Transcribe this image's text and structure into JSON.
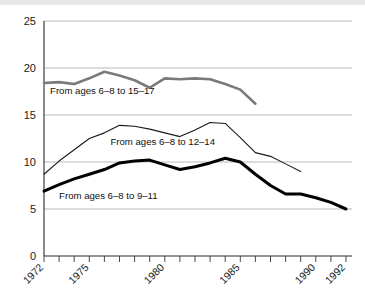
{
  "chart_data": {
    "type": "line",
    "title": "",
    "subtitle": "",
    "xlabel": "",
    "ylabel": "",
    "xlim": [
      1972,
      1992
    ],
    "ylim": [
      0,
      25
    ],
    "yticks": [
      0,
      5,
      10,
      15,
      20,
      25
    ],
    "ytick_labels": [
      "0",
      "5",
      "10",
      "15",
      "20",
      "25"
    ],
    "xticks": [
      1972,
      1973,
      1974,
      1975,
      1976,
      1977,
      1978,
      1979,
      1980,
      1981,
      1982,
      1983,
      1984,
      1985,
      1986,
      1987,
      1988,
      1989,
      1990,
      1991,
      1992
    ],
    "xtick_labels_shown": [
      "1972",
      "1975",
      "1980",
      "1985",
      "1990",
      "1992"
    ],
    "xtick_labels_shown_at": [
      1972,
      1975,
      1980,
      1985,
      1990,
      1992
    ],
    "xtick_label_rotation_deg": -45,
    "grid": "horizontal",
    "legend_position": "inline-annotations",
    "series": [
      {
        "name": "From ages 6-8 to 15-17",
        "label": "From ages 6–8 to 15–17",
        "color": "#7a7a7a",
        "line_width": 2.6,
        "x": [
          1972,
          1973,
          1974,
          1975,
          1976,
          1977,
          1978,
          1979,
          1980,
          1981,
          1982,
          1983,
          1984,
          1985,
          1986
        ],
        "values": [
          18.4,
          18.5,
          18.3,
          18.9,
          19.6,
          19.2,
          18.7,
          17.9,
          18.9,
          18.8,
          18.9,
          18.8,
          18.3,
          17.7,
          16.2
        ],
        "label_x": 1972.4,
        "label_y": 17.2
      },
      {
        "name": "From ages 6-8 to 12-14",
        "label": "From ages 6–8 to 12–14",
        "color": "#1a1a1a",
        "line_width": 1.1,
        "x": [
          1972,
          1973,
          1974,
          1975,
          1976,
          1977,
          1978,
          1979,
          1980,
          1981,
          1982,
          1983,
          1984,
          1985,
          1986,
          1987,
          1988,
          1989
        ],
        "values": [
          8.7,
          10.1,
          11.3,
          12.5,
          13.1,
          13.9,
          13.8,
          13.5,
          13.1,
          12.7,
          13.4,
          14.2,
          14.1,
          12.6,
          11.0,
          10.6,
          9.8,
          9.0
        ],
        "label_x": 1976.4,
        "label_y": 11.8
      },
      {
        "name": "From ages 6-8 to 9-11",
        "label": "From ages 6–8 to 9–11",
        "color": "#000000",
        "line_width": 3.0,
        "x": [
          1972,
          1973,
          1974,
          1975,
          1976,
          1977,
          1978,
          1979,
          1980,
          1981,
          1982,
          1983,
          1984,
          1985,
          1986,
          1987,
          1988,
          1989,
          1990,
          1991,
          1992
        ],
        "values": [
          6.9,
          7.6,
          8.2,
          8.7,
          9.2,
          9.9,
          10.1,
          10.2,
          9.7,
          9.2,
          9.5,
          9.9,
          10.4,
          10.0,
          8.7,
          7.5,
          6.6,
          6.6,
          6.2,
          5.7,
          5.0
        ],
        "label_x": 1973.0,
        "label_y": 6.1
      }
    ]
  },
  "colors": {
    "background": "#ffffff",
    "grid": "#b9b9b9",
    "axis": "#2b2b2b",
    "text": "#111111",
    "series_15_17": "#7a7a7a",
    "series_12_14": "#1a1a1a",
    "series_9_11": "#000000"
  }
}
